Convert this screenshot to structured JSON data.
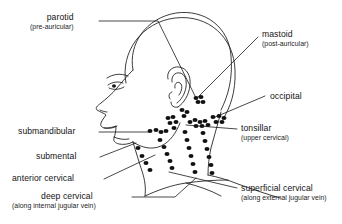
{
  "figure": {
    "type": "anatomical-diagram",
    "view": "left lateral profile of head, neck and shoulder",
    "line_color": "#1a1a1a",
    "node_color": "#111111",
    "background_color": "#ffffff"
  },
  "labels": [
    {
      "id": "parotid",
      "main": "parotid",
      "sub": "(pre-auricular)",
      "side": "left",
      "text_x": 30,
      "text_y": 13,
      "leader": "M 99,21 L 158,21 L 196,98"
    },
    {
      "id": "mastoid",
      "main": "mastoid",
      "sub": "(post-auricular)",
      "side": "right",
      "text_x": 262,
      "text_y": 30,
      "leader": "M 258,37 L 196,99"
    },
    {
      "id": "occipital",
      "main": "occipital",
      "sub": "",
      "side": "right",
      "text_x": 270,
      "text_y": 92,
      "leader": "M 265,96 L 213,118"
    },
    {
      "id": "tonsillar",
      "main": "tonsillar",
      "sub": "(upper cervical)",
      "side": "right",
      "text_x": 241,
      "text_y": 124,
      "leader": "M 237,129 L 186,125"
    },
    {
      "id": "superficial-cervical",
      "main": "superficial cervical",
      "sub": "(along external jugular vein)",
      "side": "right",
      "text_x": 241,
      "text_y": 184,
      "leader": "M 237,188 L 169,172"
    },
    {
      "id": "submandibular",
      "main": "submandibular",
      "sub": "",
      "side": "leftal",
      "text_x": 18,
      "text_y": 127,
      "leader": "M 99,132 L 148,132"
    },
    {
      "id": "submental",
      "main": "submental",
      "sub": "",
      "side": "leftal",
      "text_x": 36,
      "text_y": 152,
      "leader": "M 100,157 L 136,143"
    },
    {
      "id": "anterior-cervical",
      "main": "anterior cervical",
      "sub": "",
      "side": "leftal",
      "text_x": 12,
      "text_y": 174,
      "leader": "M 104,179 L 155,155"
    },
    {
      "id": "deep-cervical",
      "main": "deep cervical",
      "sub": "(along internal jugular vein)",
      "side": "leftal",
      "text_x": 57,
      "text_y": 192,
      "leader": "M 132,197 L 175,197 L 196,178"
    }
  ],
  "node_groups": [
    {
      "id": "parotid-nodes",
      "name": "parotid (pre-auricular) nodes",
      "nodes": [
        [
          196,
          98
        ],
        [
          201,
          97
        ],
        [
          198,
          102
        ],
        [
          203,
          102
        ]
      ]
    },
    {
      "id": "mastoid-nodes",
      "name": "mastoid (post-auricular) nodes",
      "nodes": [
        [
          190,
          122
        ],
        [
          195,
          120
        ],
        [
          200,
          122
        ],
        [
          205,
          121
        ],
        [
          196,
          126
        ],
        [
          202,
          126
        ],
        [
          208,
          125
        ]
      ]
    },
    {
      "id": "occipital-nodes",
      "name": "occipital nodes",
      "nodes": [
        [
          213,
          117
        ],
        [
          219,
          116
        ],
        [
          224,
          118
        ],
        [
          216,
          122
        ],
        [
          222,
          122
        ]
      ]
    },
    {
      "id": "submental-nodes",
      "name": "submental nodes",
      "nodes": [
        [
          150,
          131
        ],
        [
          156,
          130
        ],
        [
          161,
          132
        ],
        [
          166,
          131
        ]
      ]
    },
    {
      "id": "submandibular-nodes",
      "name": "submandibular nodes",
      "nodes": [
        [
          168,
          118
        ],
        [
          173,
          117
        ],
        [
          170,
          123
        ],
        [
          176,
          122
        ],
        [
          174,
          128
        ]
      ]
    },
    {
      "id": "tonsillar-nodes",
      "name": "tonsillar (upper cervical) nodes",
      "nodes": [
        [
          182,
          110
        ],
        [
          187,
          112
        ],
        [
          184,
          116
        ]
      ]
    },
    {
      "id": "anterior-cervical-chain",
      "name": "anterior cervical chain",
      "nodes": [
        [
          160,
          140
        ],
        [
          164,
          147
        ],
        [
          167,
          154
        ],
        [
          170,
          161
        ],
        [
          172,
          168
        ]
      ]
    },
    {
      "id": "deep-cervical-chain",
      "name": "deep cervical chain (internal jugular)",
      "nodes": [
        [
          185,
          132
        ],
        [
          187,
          140
        ],
        [
          189,
          148
        ],
        [
          191,
          156
        ],
        [
          193,
          164
        ],
        [
          195,
          172
        ]
      ]
    },
    {
      "id": "superficial-cervical-chain",
      "name": "superficial cervical chain (external jugular)",
      "nodes": [
        [
          203,
          133
        ],
        [
          205,
          141
        ],
        [
          207,
          149
        ],
        [
          209,
          157
        ],
        [
          211,
          165
        ],
        [
          212,
          173
        ]
      ]
    },
    {
      "id": "posterior-cervical-chain",
      "name": "posterior cervical chain",
      "nodes": [
        [
          138,
          148
        ],
        [
          142,
          156
        ],
        [
          146,
          163
        ],
        [
          150,
          170
        ]
      ]
    }
  ]
}
